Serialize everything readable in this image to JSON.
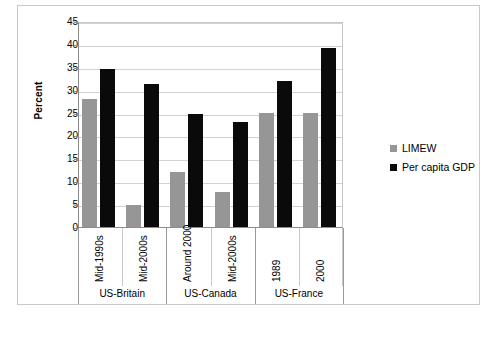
{
  "chart_data": {
    "type": "bar",
    "title": "",
    "xlabel": "",
    "ylabel": "Percent",
    "ylim": [
      0,
      45
    ],
    "ytick_step": 5,
    "yticks": [
      45,
      40,
      35,
      30,
      25,
      20,
      15,
      10,
      5,
      0
    ],
    "grid": true,
    "legend_position": "right",
    "categories": [
      "Mid-1990s",
      "Mid-2000s",
      "Around 2000",
      "Mid-2000s",
      "1989",
      "2000"
    ],
    "groups": [
      {
        "label": "US-Britain",
        "categories": [
          "Mid-1990s",
          "Mid-2000s"
        ]
      },
      {
        "label": "US-Canada",
        "categories": [
          "Around 2000",
          "Mid-2000s"
        ]
      },
      {
        "label": "US-France",
        "categories": [
          "1989",
          "2000"
        ]
      }
    ],
    "series": [
      {
        "name": "LIMEW",
        "color": "#969696",
        "values": [
          28.0,
          4.8,
          12.0,
          7.7,
          25.0,
          25.0
        ]
      },
      {
        "name": "Per capita GDP",
        "color": "#0a0a0a",
        "values": [
          34.5,
          31.2,
          24.7,
          23.0,
          32.0,
          39.0
        ]
      }
    ]
  },
  "legend": {
    "items": [
      {
        "label": "LIMEW",
        "color": "#969696"
      },
      {
        "label": "Per capita GDP",
        "color": "#0a0a0a"
      }
    ]
  }
}
